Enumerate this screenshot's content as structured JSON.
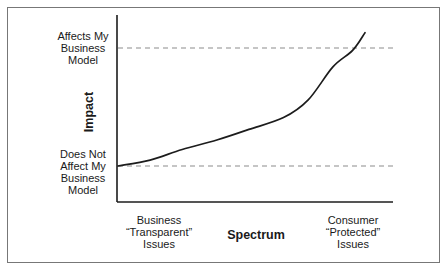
{
  "colors": {
    "line": "#1c1c1c",
    "dashed": "#8c8c8c",
    "text": "#1a1a1a",
    "border": "#777777",
    "background": "#ffffff"
  },
  "figure": {
    "y_axis": {
      "title": "Impact",
      "high_label": "Affects My\nBusiness\nModel",
      "low_label": "Does Not\nAffect My\nBusiness\nModel"
    },
    "x_axis": {
      "title": "Spectrum",
      "left_label": "Business\n“Transparent”\nIssues",
      "right_label": "Consumer\n“Protected”\nIssues"
    }
  },
  "chart_data": {
    "type": "line",
    "title": "",
    "xlabel": "Spectrum",
    "ylabel": "Impact",
    "x_tick_labels": [
      "Business “Transparent” Issues",
      "Consumer “Protected” Issues"
    ],
    "y_reference_levels": [
      {
        "label": "Does Not Affect My Business Model",
        "value": 0
      },
      {
        "label": "Affects My Business Model",
        "value": 1
      }
    ],
    "series": [
      {
        "name": "impact-curve",
        "x": [
          0,
          0.13,
          0.26,
          0.4,
          0.53,
          0.67,
          0.77,
          0.87,
          0.95,
          1.0
        ],
        "values": [
          0,
          0.05,
          0.14,
          0.22,
          0.31,
          0.41,
          0.56,
          0.84,
          0.98,
          1.13
        ]
      }
    ],
    "grid": false,
    "legend": false
  }
}
